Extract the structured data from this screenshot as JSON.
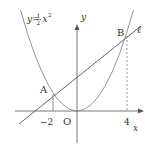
{
  "diagram": {
    "type": "coordinate-graph",
    "curve": {
      "equation_prefix": "y=",
      "frac_num": "1",
      "frac_den": "2",
      "var": "x",
      "exp": "2",
      "color": "#8a8a8a"
    },
    "line": {
      "label": "ℓ",
      "equation": "y = x + 4",
      "color": "#555555"
    },
    "axes": {
      "x_label": "x",
      "y_label": "y",
      "origin_label": "O"
    },
    "points": [
      {
        "name": "A",
        "x": -2,
        "y": 2
      },
      {
        "name": "B",
        "x": 4,
        "y": 8
      }
    ],
    "ticks": {
      "neg2": "−2",
      "pos4": "4"
    },
    "colors": {
      "axis": "#555555",
      "curve": "#8a8a8a",
      "dashed": "#666666",
      "text": "#333333"
    }
  }
}
